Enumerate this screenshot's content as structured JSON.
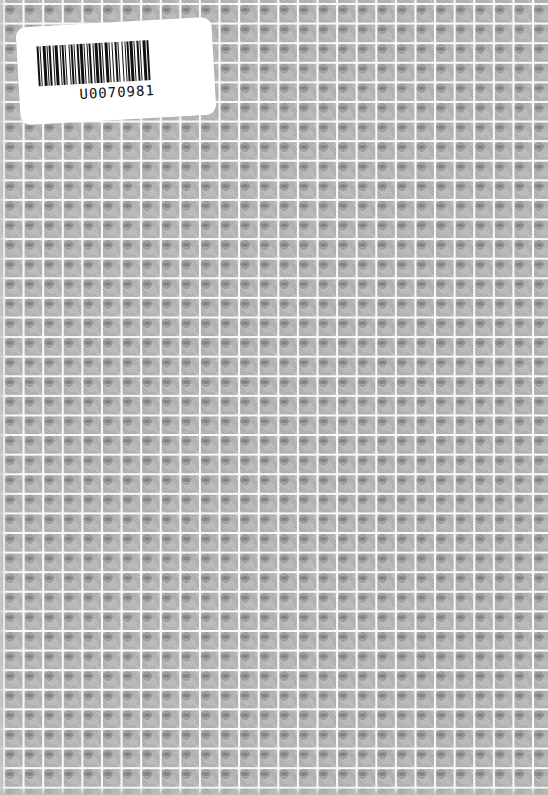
{
  "cover": {
    "pattern": "repeating-gray-tile-grid",
    "background_color": "#c8c8c8",
    "gridline_color": "#fafafa"
  },
  "barcode_label": {
    "code_text": "U0070981",
    "label_color": "#ffffff",
    "bar_color": "#111111"
  }
}
